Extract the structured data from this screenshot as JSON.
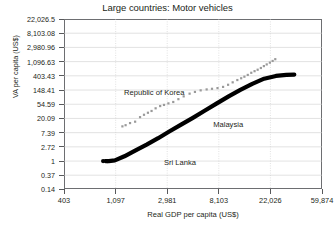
{
  "chart_data": {
    "type": "scatter",
    "title": "Large countries: Motor vehicles",
    "xlabel": "Real GDP per capita (US$)",
    "ylabel": "VA per capita (US$)",
    "x_scale": "log",
    "y_scale": "log",
    "grid": true,
    "legend_position": "none",
    "xticks": [
      "403",
      "1,097",
      "2,981",
      "8,103",
      "22,026",
      "59,874"
    ],
    "xtick_values": [
      403,
      1097,
      2981,
      8103,
      22026,
      59874
    ],
    "yticks": [
      "22,026.5",
      "8,103.08",
      "2,980.96",
      "1,096.63",
      "403.43",
      "148.41",
      "54.59",
      "20.09",
      "7.39",
      "2.72",
      "1",
      "0.37",
      "0.14"
    ],
    "ytick_values": [
      22026.5,
      8103.08,
      2980.96,
      1096.63,
      403.43,
      148.41,
      54.59,
      20.09,
      7.39,
      2.72,
      1,
      0.37,
      0.14
    ],
    "xlim": [
      403,
      59874
    ],
    "ylim": [
      0.14,
      22026.5
    ],
    "annotations": [
      {
        "text": "Republic of Korea",
        "x": 2400,
        "y": 120
      },
      {
        "text": "Malaysia",
        "x": 13500,
        "y": 12.5
      },
      {
        "text": "Sri Lanka",
        "x": 5200,
        "y": 0.85
      }
    ],
    "series": [
      {
        "name": "Republic of Korea",
        "style": "scatter",
        "color": "#9a9a9a",
        "points": [
          {
            "x": 1250,
            "y": 11.5
          },
          {
            "x": 1330,
            "y": 12.5
          },
          {
            "x": 1450,
            "y": 14.5
          },
          {
            "x": 1600,
            "y": 16.0
          },
          {
            "x": 1760,
            "y": 22.0
          },
          {
            "x": 1900,
            "y": 26.0
          },
          {
            "x": 2050,
            "y": 30.0
          },
          {
            "x": 2200,
            "y": 34.0
          },
          {
            "x": 2380,
            "y": 41.0
          },
          {
            "x": 2600,
            "y": 48.0
          },
          {
            "x": 2800,
            "y": 52.0
          },
          {
            "x": 3050,
            "y": 58.0
          },
          {
            "x": 3350,
            "y": 64.0
          },
          {
            "x": 3700,
            "y": 78.0
          },
          {
            "x": 4100,
            "y": 95.0
          },
          {
            "x": 4600,
            "y": 115.0
          },
          {
            "x": 5100,
            "y": 130.0
          },
          {
            "x": 5700,
            "y": 145.0
          },
          {
            "x": 6400,
            "y": 155.0
          },
          {
            "x": 7100,
            "y": 162.0
          },
          {
            "x": 7900,
            "y": 170.0
          },
          {
            "x": 8800,
            "y": 185.0
          },
          {
            "x": 9700,
            "y": 215.0
          },
          {
            "x": 10600,
            "y": 255.0
          },
          {
            "x": 11600,
            "y": 300.0
          },
          {
            "x": 12500,
            "y": 340.0
          },
          {
            "x": 13300,
            "y": 380.0
          },
          {
            "x": 14200,
            "y": 430.0
          },
          {
            "x": 15200,
            "y": 500.0
          },
          {
            "x": 16200,
            "y": 560.0
          },
          {
            "x": 17200,
            "y": 620.0
          },
          {
            "x": 18300,
            "y": 700.0
          },
          {
            "x": 19400,
            "y": 800.0
          },
          {
            "x": 20500,
            "y": 900.0
          },
          {
            "x": 21800,
            "y": 1020.0
          },
          {
            "x": 23000,
            "y": 1150.0
          },
          {
            "x": 24200,
            "y": 1300.0
          }
        ]
      },
      {
        "name": "Malaysia",
        "style": "thick-curve",
        "color": "#000000",
        "points": [
          {
            "x": 900,
            "y": 1.0
          },
          {
            "x": 960,
            "y": 1.0
          },
          {
            "x": 1080,
            "y": 1.05
          },
          {
            "x": 1300,
            "y": 1.4
          },
          {
            "x": 1600,
            "y": 2.1
          },
          {
            "x": 2000,
            "y": 3.2
          },
          {
            "x": 2500,
            "y": 5.0
          },
          {
            "x": 3100,
            "y": 8.0
          },
          {
            "x": 3900,
            "y": 13.0
          },
          {
            "x": 4900,
            "y": 21.0
          },
          {
            "x": 6200,
            "y": 35.0
          },
          {
            "x": 7800,
            "y": 58.0
          },
          {
            "x": 9800,
            "y": 95.0
          },
          {
            "x": 12300,
            "y": 150.0
          },
          {
            "x": 15500,
            "y": 230.0
          },
          {
            "x": 19500,
            "y": 330.0
          },
          {
            "x": 24500,
            "y": 400.0
          },
          {
            "x": 30000,
            "y": 430.0
          },
          {
            "x": 35000,
            "y": 440.0
          }
        ]
      },
      {
        "name": "Sri Lanka",
        "style": "dot-pair",
        "color": "#000000",
        "points": [
          {
            "x": 860,
            "y": 1.0
          },
          {
            "x": 930,
            "y": 1.0
          }
        ]
      }
    ]
  }
}
